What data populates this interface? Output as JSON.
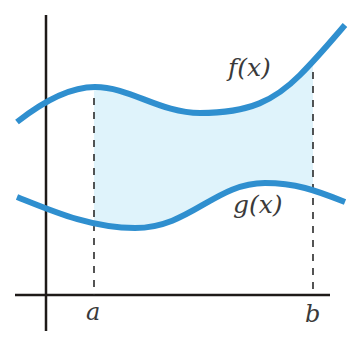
{
  "diagram": {
    "labels": {
      "f": "f(x)",
      "g": "g(x)",
      "a": "a",
      "b": "b"
    },
    "colors": {
      "curve": "#2f8fcf",
      "region_fill": "#dff3fb",
      "axis": "#1e1a18",
      "dashed": "#2a2a2a",
      "text": "#3a3a3a"
    },
    "curves": {
      "f": "M17,122 C45,100 70,87 95,87 C130,87 160,113 200,113 C250,113 275,100 300,75 C318,57 332,40 345,25",
      "g": "M17,197 C50,210 90,228 135,228 C190,228 215,183 265,183 C295,183 315,190 345,202"
    },
    "bounds": {
      "a_x": 94,
      "b_x": 313
    },
    "axes": {
      "y_axis": {
        "x": 46,
        "y1": 15,
        "y2": 331
      },
      "x_axis": {
        "y": 295,
        "x1": 15,
        "x2": 330
      }
    }
  }
}
